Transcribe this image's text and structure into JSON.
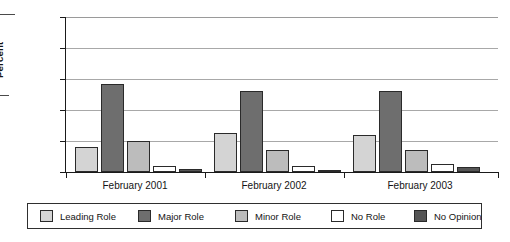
{
  "chart_data": {
    "type": "bar",
    "title": "",
    "subtitle": "",
    "xlabel": "",
    "ylabel": "Percent",
    "ylim": [
      0,
      100
    ],
    "yticks": [
      0,
      20,
      40,
      60,
      80,
      100
    ],
    "grid": true,
    "legend_position": "bottom",
    "categories": [
      "February 2001",
      "February 2002",
      "February 2003"
    ],
    "series": [
      {
        "name": "Leading Role",
        "color": "#d4d4d4",
        "values": [
          16,
          25,
          24
        ]
      },
      {
        "name": "Major Role",
        "color": "#6e6e6e",
        "values": [
          57,
          52,
          52
        ]
      },
      {
        "name": "Minor Role",
        "color": "#bcbcbc",
        "values": [
          20,
          14,
          14
        ]
      },
      {
        "name": "No Role",
        "color": "#ffffff",
        "values": [
          4,
          4,
          5
        ]
      },
      {
        "name": "No Opinion",
        "color": "#555555",
        "values": [
          2,
          1,
          3
        ]
      }
    ]
  },
  "axis": {
    "y_title": "Percent",
    "y_tick_labels": [
      "0",
      "20",
      "40",
      "60",
      "80",
      "100"
    ],
    "x_tick_labels": [
      "February 2001",
      "February 2002",
      "February 2003"
    ]
  },
  "legend": {
    "items": [
      {
        "label": "Leading Role",
        "color": "#d4d4d4"
      },
      {
        "label": "Major Role",
        "color": "#6e6e6e"
      },
      {
        "label": "Minor Role",
        "color": "#bcbcbc"
      },
      {
        "label": "No Role",
        "color": "#ffffff"
      },
      {
        "label": "No Opinion",
        "color": "#555555"
      }
    ]
  }
}
